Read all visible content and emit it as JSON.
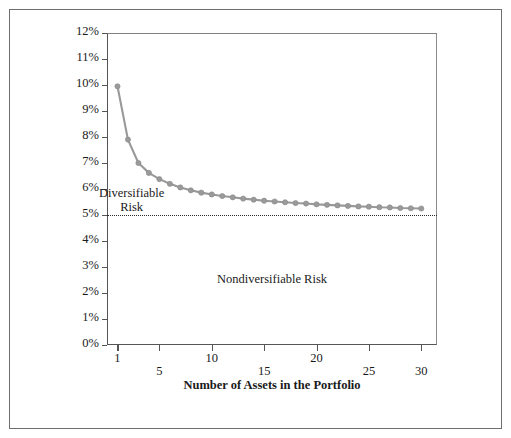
{
  "figure": {
    "background": "#ffffff",
    "border_color": "#6e6e6e"
  },
  "annotations": {
    "diversifiable_line1": "Diversifiable",
    "diversifiable_line2": "Risk",
    "nondiversifiable": "Nondiversifiable Risk"
  },
  "chart_data": {
    "type": "line",
    "title": "",
    "xlabel": "Number of Assets in the Portfolio",
    "ylabel": "Standard Deviation of Portfolio Expected Returns",
    "xlim": [
      0,
      31.5
    ],
    "ylim": [
      0,
      12
    ],
    "grid": false,
    "legend": "none",
    "series_color": "#999999",
    "marker": "circle",
    "xticks": [
      1,
      5,
      10,
      15,
      20,
      25,
      30
    ],
    "xticklabels": [
      "1",
      "5",
      "10",
      "15",
      "20",
      "25",
      "30"
    ],
    "xticklabel_rows": [
      "up",
      "down",
      "up",
      "down",
      "up",
      "down",
      "down"
    ],
    "yticks": [
      0,
      1,
      2,
      3,
      4,
      5,
      6,
      7,
      8,
      9,
      10,
      11,
      12
    ],
    "yticklabels": [
      "0%",
      "1%",
      "2%",
      "3%",
      "4%",
      "5%",
      "6%",
      "7%",
      "8%",
      "9%",
      "10%",
      "11%",
      "12%"
    ],
    "x": [
      1,
      2,
      3,
      4,
      5,
      6,
      7,
      8,
      9,
      10,
      11,
      12,
      13,
      14,
      15,
      16,
      17,
      18,
      19,
      20,
      21,
      22,
      23,
      24,
      25,
      26,
      27,
      28,
      29,
      30
    ],
    "values": [
      9.95,
      7.9,
      7.0,
      6.62,
      6.38,
      6.2,
      6.06,
      5.95,
      5.86,
      5.79,
      5.73,
      5.68,
      5.63,
      5.59,
      5.55,
      5.52,
      5.49,
      5.46,
      5.44,
      5.41,
      5.39,
      5.37,
      5.35,
      5.33,
      5.32,
      5.3,
      5.29,
      5.27,
      5.26,
      5.25
    ],
    "reference_line": {
      "label": "Nondiversifiable risk level",
      "y": 5.0,
      "style": "dotted",
      "color": "#2a2a2a"
    },
    "annotations": [
      {
        "text": "Diversifiable Risk",
        "x": 4.2,
        "y": 5.85
      },
      {
        "text": "Nondiversifiable Risk",
        "x": 16,
        "y": 2.55
      }
    ]
  }
}
